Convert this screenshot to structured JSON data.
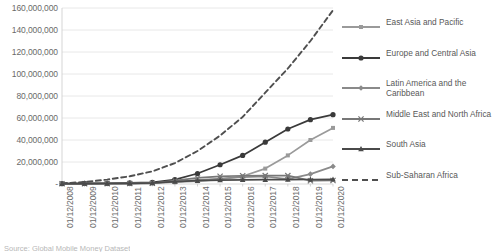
{
  "chart_data": {
    "type": "line",
    "title": "",
    "xlabel": "",
    "ylabel": "",
    "grid": true,
    "legend_position": "right",
    "ylim": [
      0,
      160000000
    ],
    "y_ticks": [
      "-",
      "20,000,000",
      "40,000,000",
      "60,000,000",
      "80,000,000",
      "100,000,000",
      "120,000,000",
      "140,000,000",
      "160,000,000"
    ],
    "y_tick_values": [
      0,
      20000000,
      40000000,
      60000000,
      80000000,
      100000000,
      120000000,
      140000000,
      160000000
    ],
    "categories": [
      "01/12/2008",
      "01/12/2009",
      "01/12/2010",
      "01/12/2011",
      "01/12/2012",
      "01/12/2013",
      "01/12/2014",
      "01/12/2015",
      "01/12/2016",
      "01/12/2017",
      "01/12/2018",
      "01/12/2019",
      "01/12/2020"
    ],
    "series": [
      {
        "name": "East Asia and Pacific",
        "marker": "square",
        "color": "#9a9a9a",
        "dash": "none",
        "values": [
          300000,
          400000,
          500000,
          700000,
          1000000,
          1600000,
          2600000,
          4200000,
          7000000,
          14000000,
          26000000,
          40000000,
          51000000
        ]
      },
      {
        "name": "Europe and Central Asia",
        "marker": "circle",
        "color": "#3a3a3a",
        "dash": "none",
        "values": [
          400000,
          500000,
          700000,
          1000000,
          1500000,
          4000000,
          9500000,
          17500000,
          26000000,
          38000000,
          50000000,
          58500000,
          63000000
        ]
      },
      {
        "name": "Latin America and the Caribbean",
        "marker": "diamond",
        "color": "#8a8a8a",
        "dash": "none",
        "values": [
          200000,
          300000,
          400000,
          600000,
          900000,
          2000000,
          3500000,
          5000000,
          6200000,
          6800000,
          4500000,
          9000000,
          16000000
        ]
      },
      {
        "name": "Middle East and North Africa",
        "marker": "x",
        "color": "#777777",
        "dash": "none",
        "values": [
          150000,
          200000,
          300000,
          400000,
          600000,
          3000000,
          5500000,
          7000000,
          7500000,
          7600000,
          7600000,
          3000000,
          3200000
        ]
      },
      {
        "name": "South Asia",
        "marker": "triangle",
        "color": "#4a4a4a",
        "dash": "none",
        "values": [
          250000,
          350000,
          450000,
          600000,
          900000,
          2200000,
          3000000,
          3600000,
          3800000,
          3900000,
          4000000,
          4100000,
          4200000
        ]
      },
      {
        "name": "Sub-Saharan Africa",
        "marker": "none",
        "color": "#4f4f4f",
        "dash": "dashed",
        "values": [
          600000,
          1800000,
          4000000,
          7000000,
          11500000,
          19000000,
          30000000,
          44000000,
          61000000,
          83000000,
          105000000,
          130000000,
          158000000
        ]
      }
    ]
  },
  "legend": {
    "items": [
      {
        "label": "East Asia and Pacific"
      },
      {
        "label": "Europe and Central Asia"
      },
      {
        "label": "Latin America and the Caribbean"
      },
      {
        "label": "Middle East and North Africa"
      },
      {
        "label": "South Asia"
      },
      {
        "label": "Sub-Saharan Africa"
      }
    ]
  },
  "footer": {
    "source_note": "Source: Global Mobile Money Dataset"
  },
  "colors": {
    "gridline": "#e2e2e2",
    "axis": "#d0d0d0",
    "text": "#6a6a6a"
  }
}
